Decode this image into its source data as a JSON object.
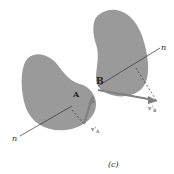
{
  "figure": {
    "caption": "(c)",
    "colors": {
      "body_fill": "#9a9a9a",
      "line": "#333333",
      "vector": "#808080",
      "background": "#ffffff"
    },
    "bodies": [
      {
        "name": "body-A",
        "point_label": "A",
        "normal_label_start": "n",
        "velocity_label": "v'",
        "velocity_subscript": "A"
      },
      {
        "name": "body-B",
        "point_label": "B",
        "normal_label_end": "n",
        "velocity_label": "v'",
        "velocity_subscript": "B"
      }
    ]
  }
}
